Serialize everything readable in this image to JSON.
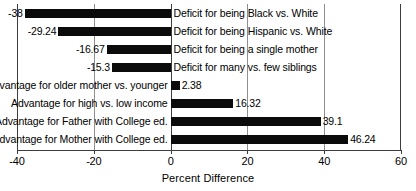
{
  "chart_data": {
    "type": "bar",
    "orientation": "horizontal",
    "title": "",
    "xlabel": "Percent Difference",
    "ylabel": "",
    "xlim": [
      -40,
      60
    ],
    "xticks": [
      -40,
      -20,
      0,
      20,
      40,
      60
    ],
    "xtick_labels": [
      "-40",
      "-20",
      "0",
      "20",
      "40",
      "60"
    ],
    "grid": true,
    "grid_axis": "x",
    "legend": "none",
    "bar_color": "#0b0b0b",
    "categories": [
      "Deficit for being Black vs. White",
      "Deficit for being Hispanic vs. White",
      "Deficit for being a single mother",
      "Deficit for many vs. few siblings",
      "Advantage for older mother vs. younger",
      "Advantage for high vs. low income",
      "Advantage for Father with College ed.",
      "Advantage for Mother with College ed."
    ],
    "values": [
      -38,
      -29.24,
      -16.67,
      -15.3,
      2.38,
      16.32,
      39.1,
      46.24
    ],
    "value_labels": [
      "-38",
      "-29.24",
      "-16.67",
      "-15.3",
      "2.38",
      "16.32",
      "39.1",
      "46.24"
    ]
  },
  "bars": [
    {
      "category": "Deficit for being Black vs. White",
      "value": -38,
      "value_label": "-38"
    },
    {
      "category": "Deficit for being Hispanic vs. White",
      "value": -29.24,
      "value_label": "-29.24"
    },
    {
      "category": "Deficit for being a single mother",
      "value": -16.67,
      "value_label": "-16.67"
    },
    {
      "category": "Deficit for many vs. few siblings",
      "value": -15.3,
      "value_label": "-15.3"
    },
    {
      "category": "Advantage for older mother vs. younger",
      "value": 2.38,
      "value_label": "2.38"
    },
    {
      "category": "Advantage for high vs. low income",
      "value": 16.32,
      "value_label": "16.32"
    },
    {
      "category": "Advantage for Father with College ed.",
      "value": 39.1,
      "value_label": "39.1"
    },
    {
      "category": "Advantage for Mother with College ed.",
      "value": 46.24,
      "value_label": "46.24"
    }
  ],
  "axis": {
    "title": "Percent Difference",
    "ticks": [
      {
        "value": -40,
        "label": "-40"
      },
      {
        "value": -20,
        "label": "-20"
      },
      {
        "value": 0,
        "label": "0"
      },
      {
        "value": 20,
        "label": "20"
      },
      {
        "value": 40,
        "label": "40"
      },
      {
        "value": 60,
        "label": "60"
      }
    ]
  }
}
